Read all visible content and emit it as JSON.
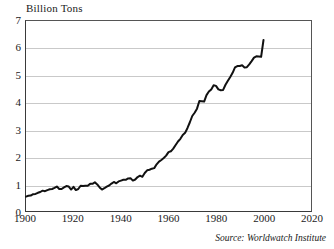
{
  "chart_data": {
    "type": "line",
    "title": "",
    "ylabel": "Billion Tons",
    "xlabel": "",
    "xlim": [
      1900,
      2020
    ],
    "ylim": [
      0,
      7
    ],
    "grid": true,
    "legend": null,
    "annotation": "Source: Worldwatch Institute",
    "y_ticks": [
      "0",
      "1",
      "2",
      "3",
      "4",
      "5",
      "6",
      "7"
    ],
    "x_ticks": [
      "1900",
      "1920",
      "1940",
      "1960",
      "1980",
      "2000",
      "2020"
    ],
    "line_color": "#111111",
    "grid_color": "#c9c9c9",
    "axis_color": "#3a3a3a",
    "series": [
      {
        "name": "Global Carbon Emissions",
        "x": [
          1900,
          1901,
          1902,
          1903,
          1904,
          1905,
          1906,
          1907,
          1908,
          1909,
          1910,
          1911,
          1912,
          1913,
          1914,
          1915,
          1916,
          1917,
          1918,
          1919,
          1920,
          1921,
          1922,
          1923,
          1924,
          1925,
          1926,
          1927,
          1928,
          1929,
          1930,
          1931,
          1932,
          1933,
          1934,
          1935,
          1936,
          1937,
          1938,
          1939,
          1940,
          1941,
          1942,
          1943,
          1944,
          1945,
          1946,
          1947,
          1948,
          1949,
          1950,
          1951,
          1952,
          1953,
          1954,
          1955,
          1956,
          1957,
          1958,
          1959,
          1960,
          1961,
          1962,
          1963,
          1964,
          1965,
          1966,
          1967,
          1968,
          1969,
          1970,
          1971,
          1972,
          1973,
          1974,
          1975,
          1976,
          1977,
          1978,
          1979,
          1980,
          1981,
          1982,
          1983,
          1984,
          1985,
          1986,
          1987,
          1988,
          1989,
          1990,
          1991,
          1992,
          1993,
          1994,
          1995,
          1996,
          1997,
          1998,
          1999,
          2000
        ],
        "values": [
          0.53,
          0.56,
          0.57,
          0.62,
          0.63,
          0.67,
          0.7,
          0.75,
          0.73,
          0.77,
          0.8,
          0.81,
          0.85,
          0.9,
          0.81,
          0.81,
          0.87,
          0.92,
          0.9,
          0.79,
          0.89,
          0.77,
          0.81,
          0.93,
          0.92,
          0.93,
          0.93,
          1.0,
          1.0,
          1.06,
          0.98,
          0.87,
          0.79,
          0.84,
          0.9,
          0.94,
          1.01,
          1.07,
          1.02,
          1.09,
          1.12,
          1.15,
          1.15,
          1.2,
          1.21,
          1.12,
          1.16,
          1.25,
          1.3,
          1.26,
          1.4,
          1.5,
          1.52,
          1.56,
          1.58,
          1.72,
          1.82,
          1.88,
          1.95,
          2.04,
          2.17,
          2.2,
          2.3,
          2.43,
          2.56,
          2.66,
          2.8,
          2.88,
          3.06,
          3.27,
          3.5,
          3.62,
          3.77,
          4.05,
          4.04,
          4.03,
          4.27,
          4.4,
          4.48,
          4.63,
          4.61,
          4.48,
          4.45,
          4.46,
          4.65,
          4.8,
          4.94,
          5.09,
          5.29,
          5.34,
          5.34,
          5.37,
          5.29,
          5.3,
          5.4,
          5.52,
          5.65,
          5.7,
          5.69,
          5.68,
          6.3
        ]
      }
    ]
  }
}
